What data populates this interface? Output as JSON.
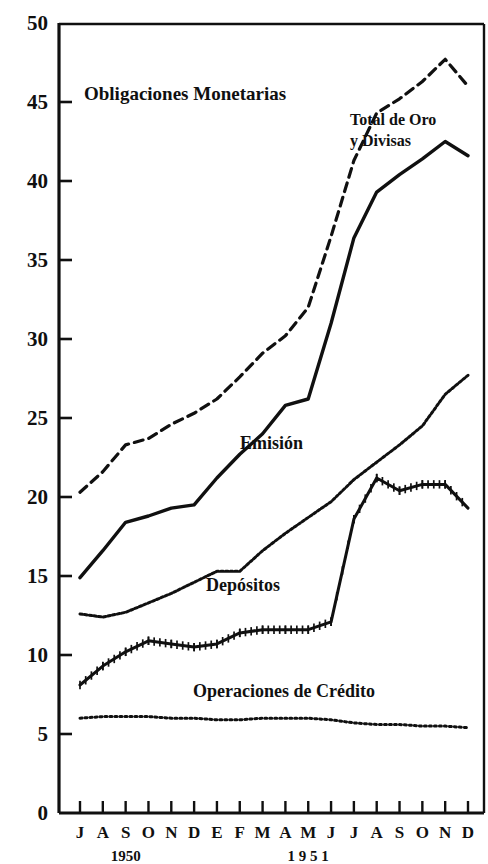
{
  "chart_data": {
    "type": "line",
    "title": "Obligaciones Monetarias",
    "xlabel": "",
    "ylabel": "",
    "ylim": [
      0,
      50
    ],
    "yticks": [
      "0",
      "5",
      "10",
      "15",
      "20",
      "25",
      "30",
      "35",
      "40",
      "45",
      "50"
    ],
    "grid": false,
    "legend_position": "inline-annotations",
    "x": [
      "J",
      "A",
      "S",
      "O",
      "N",
      "D",
      "E",
      "F",
      "M",
      "A",
      "M",
      "J",
      "J",
      "A",
      "S",
      "O",
      "N",
      "D"
    ],
    "xtick_labels": [
      "J",
      "A",
      "S",
      "O",
      "N",
      "D",
      "E",
      "F",
      "M",
      "A",
      "M",
      "J",
      "J",
      "A",
      "S",
      "O",
      "N",
      "D"
    ],
    "x_group_labels": [
      {
        "text": "1950",
        "at_index": 2
      },
      {
        "text": "1 9 5 1",
        "at_index": 10
      }
    ],
    "series": [
      {
        "name": "Total de Oro y Divisas",
        "style": "dashed",
        "label_x_index": 13.0,
        "label_y_value": 44.4,
        "values": [
          20.3,
          21.6,
          23.3,
          23.7,
          24.6,
          25.3,
          26.2,
          27.6,
          29.1,
          30.2,
          32.0,
          36.5,
          41.3,
          44.3,
          45.2,
          46.3,
          47.7,
          46.0
        ]
      },
      {
        "name": "Emisión",
        "style": "solid",
        "label_x_index": 7.6,
        "label_y_value": 23.4,
        "values": [
          14.9,
          16.6,
          18.4,
          18.8,
          19.3,
          19.5,
          21.2,
          22.7,
          24.0,
          25.8,
          26.2,
          31.0,
          36.4,
          39.3,
          40.4,
          41.4,
          42.5,
          41.6
        ]
      },
      {
        "name": "Depósitos",
        "style": "dotted-fine",
        "label_x_index": 7.3,
        "label_y_value": 15.0,
        "values": [
          12.6,
          12.4,
          12.7,
          13.3,
          13.9,
          14.6,
          15.3,
          15.3,
          16.6,
          17.7,
          18.7,
          19.7,
          21.1,
          22.2,
          23.3,
          24.5,
          26.5,
          27.7
        ]
      },
      {
        "name": "Operaciones de Crédito",
        "style": "tick-marked",
        "label_x_index": 6.6,
        "label_y_value": 15.6,
        "values": [
          8.1,
          9.3,
          10.2,
          10.9,
          10.7,
          10.5,
          10.7,
          11.4,
          11.6,
          11.6,
          11.6,
          12.1,
          18.6,
          21.2,
          20.4,
          20.8,
          20.8,
          19.3
        ]
      },
      {
        "name": "Operaciones de Crédito línea",
        "style": "dotted-coarse",
        "label_x_index": 8.6,
        "label_y_value": 7.9,
        "values": [
          6.0,
          6.1,
          6.1,
          6.1,
          6.0,
          6.0,
          5.9,
          5.9,
          6.0,
          6.0,
          6.0,
          5.9,
          5.7,
          5.6,
          5.6,
          5.5,
          5.5,
          5.4
        ]
      }
    ],
    "annotations": [
      {
        "text": "Obligaciones Monetarias",
        "role": "chart-title"
      },
      {
        "text": "Total de Oro y Divisas",
        "role": "series-annotation",
        "line1": "Total de Oro",
        "line2": "y Divisas"
      },
      {
        "text": "Emisión",
        "role": "series-annotation"
      },
      {
        "text": "Depósitos",
        "role": "series-annotation"
      },
      {
        "text": "Operaciones de Crédito",
        "role": "series-annotation"
      }
    ],
    "colors": {
      "ink": "#101010",
      "background": "#ffffff"
    }
  },
  "labels": {
    "title": "Obligaciones Monetarias",
    "total_oro_line1": "Total de Oro",
    "total_oro_line2": "y Divisas",
    "emision": "Emisión",
    "depositos": "Depósitos",
    "operaciones": "Operaciones de Crédito",
    "year_1950": "1950",
    "year_1951": "1 9 5 1"
  }
}
